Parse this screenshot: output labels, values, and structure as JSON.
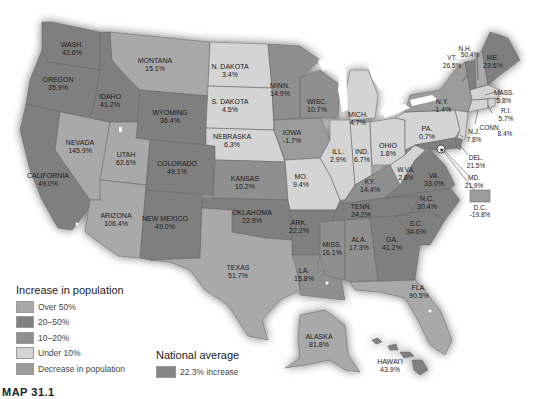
{
  "colors": {
    "over_50": "#a9a9a9",
    "20_50": "#7f7f7f",
    "10_20": "#8f8f8f",
    "under_10": "#d4d4d4",
    "decrease": "#9c9c9c",
    "national_average": "#858585",
    "water": "#ffffff",
    "border": "#6a6a6a"
  },
  "legend": {
    "title": "Increase in population",
    "items": [
      {
        "label": "Over 50%",
        "category": "over_50"
      },
      {
        "label": "20–50%",
        "category": "20_50"
      },
      {
        "label": "10–20%",
        "category": "10_20"
      },
      {
        "label": "Under 10%",
        "category": "under_10"
      },
      {
        "label": "Decrease in population",
        "category": "decrease"
      }
    ]
  },
  "national_average": {
    "title": "National average",
    "label": "22.3% increase"
  },
  "caption": "MAP 31.1",
  "states": [
    {
      "name": "WASH.",
      "value": "42.6%",
      "category": "20_50"
    },
    {
      "name": "OREGON",
      "value": "35.9%",
      "category": "20_50"
    },
    {
      "name": "IDAHO",
      "value": "41.2%",
      "category": "20_50"
    },
    {
      "name": "MONTANA",
      "value": "15.1%",
      "category": "10_20"
    },
    {
      "name": "WYOMING",
      "value": "36.4%",
      "category": "20_50"
    },
    {
      "name": "N. DAKOTA",
      "value": "3.4%",
      "category": "under_10"
    },
    {
      "name": "S. DAKOTA",
      "value": "4.5%",
      "category": "under_10"
    },
    {
      "name": "NEBRASKA",
      "value": "6.3%",
      "category": "under_10"
    },
    {
      "name": "MINN.",
      "value": "14.9%",
      "category": "10_20"
    },
    {
      "name": "IOWA",
      "value": "-1.7%",
      "category": "decrease"
    },
    {
      "name": "WISC.",
      "value": "10.7%",
      "category": "10_20"
    },
    {
      "name": "MICH.",
      "value": "4.7%",
      "category": "under_10"
    },
    {
      "name": "N.Y.",
      "value": "-1.4%",
      "category": "decrease"
    },
    {
      "name": "VT.",
      "value": "26.5%",
      "category": "20_50"
    },
    {
      "name": "N.H.",
      "value": "50.4%",
      "category": "over_50"
    },
    {
      "name": "ME.",
      "value": "23.6%",
      "category": "20_50"
    },
    {
      "name": "MASS.",
      "value": "5.8%",
      "category": "under_10"
    },
    {
      "name": "R.I.",
      "value": "5.7%",
      "category": "under_10"
    },
    {
      "name": "CONN.",
      "value": "8.4%",
      "category": "under_10"
    },
    {
      "name": "N.J.",
      "value": "7.8%",
      "category": "under_10"
    },
    {
      "name": "DEL.",
      "value": "21.5%",
      "category": "20_50"
    },
    {
      "name": "MD.",
      "value": "21.9%",
      "category": "20_50"
    },
    {
      "name": "D.C.",
      "value": "-19.8%",
      "category": "decrease"
    },
    {
      "name": "PA.",
      "value": "0.7%",
      "category": "under_10"
    },
    {
      "name": "OHIO",
      "value": "1.8%",
      "category": "under_10"
    },
    {
      "name": "IND.",
      "value": "6.7%",
      "category": "under_10"
    },
    {
      "name": "ILL.",
      "value": "2.9%",
      "category": "under_10"
    },
    {
      "name": "W.VA.",
      "value": "2.8%",
      "category": "under_10"
    },
    {
      "name": "VA.",
      "value": "33.0%",
      "category": "20_50"
    },
    {
      "name": "KY.",
      "value": "14.4%",
      "category": "10_20"
    },
    {
      "name": "TENN.",
      "value": "24.2%",
      "category": "20_50"
    },
    {
      "name": "N.C.",
      "value": "30.4%",
      "category": "20_50"
    },
    {
      "name": "S.C.",
      "value": "34.6%",
      "category": "20_50"
    },
    {
      "name": "GA.",
      "value": "41.2%",
      "category": "20_50"
    },
    {
      "name": "ALA.",
      "value": "17.3%",
      "category": "10_20"
    },
    {
      "name": "MISS.",
      "value": "16.1%",
      "category": "10_20"
    },
    {
      "name": "LA.",
      "value": "15.8%",
      "category": "10_20"
    },
    {
      "name": "ARK.",
      "value": "22.2%",
      "category": "20_50"
    },
    {
      "name": "FLA.",
      "value": "90.5%",
      "category": "over_50"
    },
    {
      "name": "MO.",
      "value": "9.4%",
      "category": "under_10"
    },
    {
      "name": "KANSAS",
      "value": "10.2%",
      "category": "10_20"
    },
    {
      "name": "OKLAHOMA",
      "value": "22.9%",
      "category": "20_50"
    },
    {
      "name": "TEXAS",
      "value": "51.7%",
      "category": "over_50"
    },
    {
      "name": "COLORADO",
      "value": "49.1%",
      "category": "20_50"
    },
    {
      "name": "NEW MEXICO",
      "value": "49.0%",
      "category": "20_50"
    },
    {
      "name": "ARIZONA",
      "value": "106.4%",
      "category": "over_50"
    },
    {
      "name": "UTAH",
      "value": "62.6%",
      "category": "over_50"
    },
    {
      "name": "NEVADA",
      "value": "145.9%",
      "category": "over_50"
    },
    {
      "name": "CALIFORNIA",
      "value": "49.0%",
      "category": "20_50"
    },
    {
      "name": "ALASKA",
      "value": "81.8%",
      "category": "over_50"
    },
    {
      "name": "HAWAI'I",
      "value": "43.9%",
      "category": "20_50"
    }
  ]
}
